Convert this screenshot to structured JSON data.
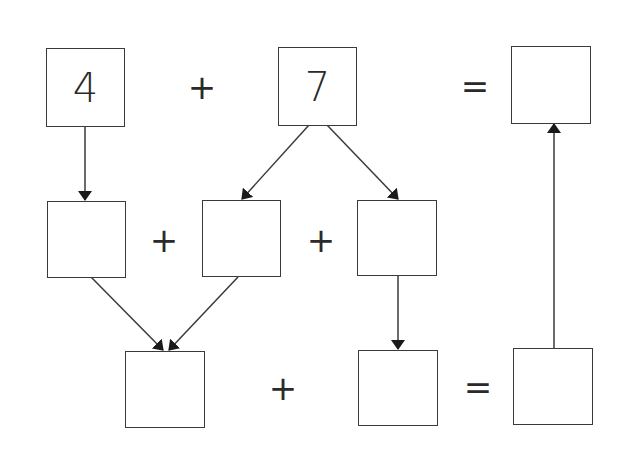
{
  "diagram": {
    "type": "addition-decomposition",
    "colors": {
      "stroke": "#3a3a3a",
      "text": "#2a2a2a",
      "background": "#ffffff"
    },
    "row1": {
      "box1": {
        "value": "4"
      },
      "op1": "+",
      "box2": {
        "value": "7"
      },
      "op2": "=",
      "result": {
        "value": ""
      }
    },
    "row2": {
      "boxA": {
        "value": ""
      },
      "op1": "+",
      "boxB": {
        "value": ""
      },
      "op2": "+",
      "boxC": {
        "value": ""
      }
    },
    "row3": {
      "boxD": {
        "value": ""
      },
      "op1": "+",
      "boxE": {
        "value": ""
      },
      "op2": "=",
      "boxF": {
        "value": ""
      }
    },
    "arrows": [
      {
        "from": "box1",
        "to": "boxA"
      },
      {
        "from": "box2",
        "to": "boxB"
      },
      {
        "from": "box2",
        "to": "boxC"
      },
      {
        "from": "boxA",
        "to": "boxD"
      },
      {
        "from": "boxB",
        "to": "boxD"
      },
      {
        "from": "boxC",
        "to": "boxE"
      },
      {
        "from": "boxF",
        "to": "result"
      }
    ]
  }
}
